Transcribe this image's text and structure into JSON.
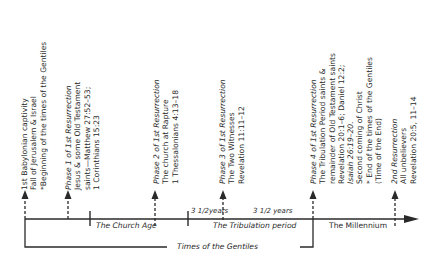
{
  "diagram": {
    "events": [
      {
        "id": "babylonian-captivity",
        "lines": [
          "1st Babylonian captivity",
          "Fall of Jerusalem & Israel",
          "*Beginning of the times of the Gentiles"
        ],
        "italic_lines": [
          false,
          false,
          false
        ]
      },
      {
        "id": "phase-1",
        "lines": [
          "Phase 1 of 1st Resurrection",
          "Jesus & some Old Testament",
          "saints—Matthew 27:52–53;",
          "1 Corinthians 15:23"
        ],
        "italic_lines": [
          true,
          false,
          false,
          false
        ]
      },
      {
        "id": "phase-2",
        "lines": [
          "Phase 2 of 1st Resurrection",
          "The church at Rapture",
          "1 Thessalonians 4:13–18"
        ],
        "italic_lines": [
          true,
          false,
          false
        ]
      },
      {
        "id": "phase-3",
        "lines": [
          "Phase 3 of 1st Resurrection",
          "The Two Witnesses",
          "Revelation 11:11–12"
        ],
        "italic_lines": [
          true,
          false,
          false
        ]
      },
      {
        "id": "phase-4",
        "lines": [
          "Phase 4 of 1st Resurrection",
          "The Tribulation Period saints &",
          "remainder of Old Testament saints",
          "Revelation 20:1–6; Daniel 12:2;",
          "Isaiah 26:19–20.",
          "Second coming of Christ",
          "* End of the times of the Gentiles",
          "(Time of the End)"
        ],
        "italic_lines": [
          true,
          false,
          false,
          false,
          true,
          false,
          false,
          false
        ]
      },
      {
        "id": "second-resurrection",
        "lines": [
          "2nd Resurrection",
          "All unbelievers",
          "Revelation 20:5, 11–14"
        ],
        "italic_lines": [
          true,
          false,
          false
        ]
      }
    ],
    "periods": {
      "church_age": "The Church Age",
      "first_half": "3 1/2years",
      "second_half": "3 1/2 years",
      "tribulation": "The Tribulation period",
      "millennium": "The Millennium",
      "times_of_gentiles": "Times of the Gentiles"
    },
    "colors": {
      "line": "#2a2a2a",
      "text": "#2a2a2a",
      "background": "#ffffff"
    }
  }
}
